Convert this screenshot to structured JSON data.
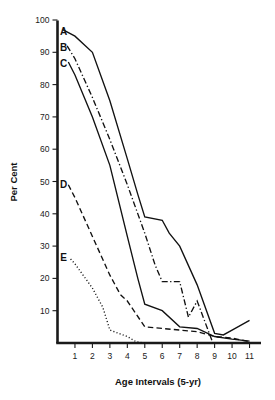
{
  "chart_data": {
    "type": "line",
    "title": "",
    "xlabel": "Age Intervals (5-yr)",
    "ylabel": "Per Cent",
    "xlim": [
      0,
      11.6
    ],
    "ylim": [
      0,
      100
    ],
    "grid": false,
    "legend_position": "inline-left-labels",
    "x_ticks": [
      "1",
      "2",
      "3",
      "4",
      "5",
      "6",
      "7",
      "8",
      "9",
      "10",
      "11"
    ],
    "x_tick_values": [
      1,
      2,
      3,
      4,
      5,
      6,
      7,
      8,
      9,
      10,
      11
    ],
    "y_ticks": [
      "10",
      "20",
      "30",
      "40",
      "50",
      "60",
      "70",
      "80",
      "90",
      "100"
    ],
    "y_tick_values": [
      10,
      20,
      30,
      40,
      50,
      60,
      70,
      80,
      90,
      100
    ],
    "series": [
      {
        "name": "A",
        "label": "A",
        "style": "solid",
        "color": "#111111",
        "label_x": 0.35,
        "label_y": 96.5,
        "x": [
          0.3,
          1.0,
          2.0,
          3.0,
          4.0,
          4.6,
          5.0,
          6.0,
          6.4,
          7.0,
          8.0,
          9.0,
          9.5,
          10.0,
          11.0
        ],
        "y": [
          97.0,
          95.0,
          90.0,
          75.0,
          57.0,
          46.0,
          39.0,
          38.0,
          34.0,
          30.0,
          18.0,
          3.0,
          2.5,
          4.0,
          7.0
        ]
      },
      {
        "name": "B",
        "label": "B",
        "style": "dash-dot",
        "color": "#111111",
        "label_x": 0.35,
        "label_y": 91.5,
        "x": [
          0.55,
          1.0,
          2.0,
          3.0,
          4.0,
          5.0,
          5.6,
          6.0,
          7.0,
          7.5,
          8.0,
          8.9
        ],
        "y": [
          92.0,
          88.0,
          76.0,
          63.0,
          49.0,
          34.0,
          24.0,
          19.0,
          19.0,
          8.0,
          13.0,
          0.0
        ]
      },
      {
        "name": "C",
        "label": "C",
        "style": "solid",
        "color": "#111111",
        "label_x": 0.35,
        "label_y": 86.5,
        "x": [
          0.62,
          1.0,
          2.0,
          3.0,
          4.0,
          4.6,
          5.0,
          6.0,
          7.0,
          8.0,
          9.0,
          10.0,
          11.0
        ],
        "y": [
          87.0,
          83.0,
          70.0,
          55.0,
          33.0,
          20.0,
          12.0,
          10.0,
          5.0,
          4.5,
          2.0,
          1.2,
          0.6
        ]
      },
      {
        "name": "D",
        "label": "D",
        "style": "dashed",
        "color": "#111111",
        "label_x": 0.35,
        "label_y": 49.0,
        "x": [
          0.62,
          1.0,
          2.0,
          3.0,
          3.6,
          4.0,
          5.0,
          6.0,
          7.0,
          8.0,
          9.0,
          10.0,
          11.0
        ],
        "y": [
          49.0,
          45.0,
          33.0,
          21.0,
          15.0,
          13.0,
          5.0,
          4.5,
          4.0,
          3.5,
          2.0,
          1.5,
          0.4
        ]
      },
      {
        "name": "E",
        "label": "E",
        "style": "dotted",
        "color": "#111111",
        "label_x": 0.35,
        "label_y": 26.5,
        "x": [
          0.75,
          1.0,
          2.0,
          2.6,
          3.0,
          4.0,
          4.5,
          5.0
        ],
        "y": [
          26.0,
          24.5,
          17.0,
          11.0,
          4.0,
          2.0,
          0.4,
          0.0
        ]
      }
    ]
  }
}
